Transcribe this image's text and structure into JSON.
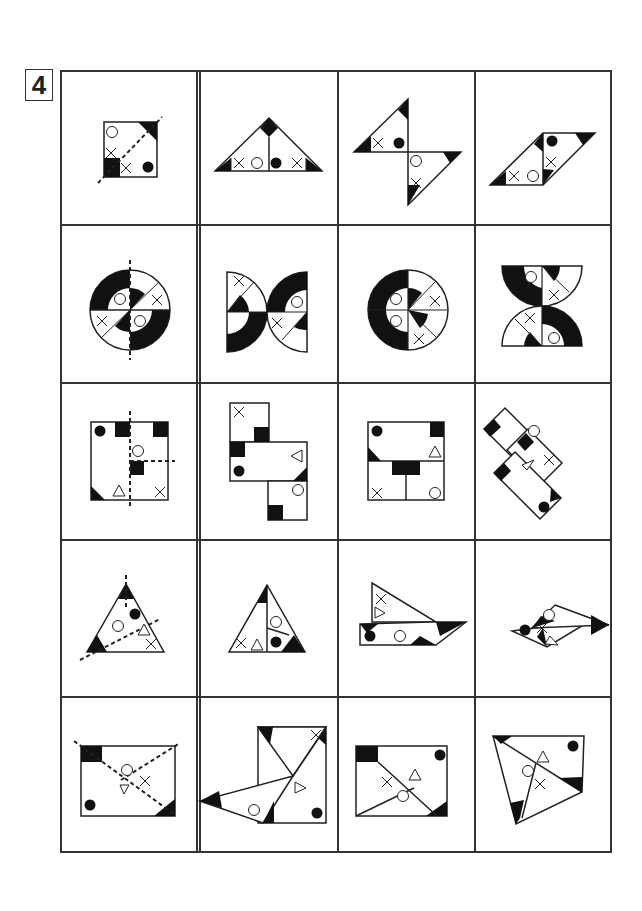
{
  "puzzle": {
    "number": "4",
    "rows": 5,
    "columns": 4,
    "layout_note": "First column separated by double line; each row: a folding template with dashed fold lines, followed by three candidate folded results",
    "symbols": [
      "circle-open",
      "circle-filled",
      "cross",
      "triangle-open",
      "black-corner"
    ],
    "cells": [
      {
        "row": 1,
        "col": 1,
        "shape": "square with diagonal dashed fold line",
        "marks": [
          "circle-open",
          "cross",
          "cross",
          "circle-filled"
        ]
      },
      {
        "row": 1,
        "col": 2,
        "shape": "triangle",
        "marks": [
          "cross",
          "circle-open",
          "circle-filled",
          "cross"
        ]
      },
      {
        "row": 1,
        "col": 3,
        "shape": "two triangles pinwheel",
        "marks": [
          "cross",
          "circle-filled",
          "circle-open",
          "cross"
        ]
      },
      {
        "row": 1,
        "col": 4,
        "shape": "parallelogram",
        "marks": [
          "circle-filled",
          "cross",
          "cross",
          "circle-open"
        ]
      },
      {
        "row": 2,
        "col": 1,
        "shape": "circle with vertical dashed fold line",
        "marks": [
          "circle-open",
          "cross",
          "cross",
          "circle-open"
        ]
      },
      {
        "row": 2,
        "col": 2,
        "shape": "two semicircles back to back",
        "marks": [
          "cross",
          "circle-open",
          "cross"
        ]
      },
      {
        "row": 2,
        "col": 3,
        "shape": "circle quarters",
        "marks": [
          "circle-open",
          "cross",
          "circle-open",
          "cross"
        ]
      },
      {
        "row": 2,
        "col": 4,
        "shape": "hourglass semicircles",
        "marks": [
          "circle-open",
          "cross",
          "cross",
          "circle-open"
        ]
      },
      {
        "row": 3,
        "col": 1,
        "shape": "square with cross dashed fold lines",
        "marks": [
          "circle-filled",
          "circle-open",
          "triangle-open",
          "cross"
        ]
      },
      {
        "row": 3,
        "col": 2,
        "shape": "stacked rectangles",
        "marks": [
          "cross",
          "triangle-open",
          "circle-filled",
          "circle-open"
        ]
      },
      {
        "row": 3,
        "col": 3,
        "shape": "square divided",
        "marks": [
          "circle-filled",
          "triangle-open",
          "cross",
          "circle-open"
        ]
      },
      {
        "row": 3,
        "col": 4,
        "shape": "rotated rectangles",
        "marks": [
          "circle-open",
          "cross",
          "triangle-open",
          "circle-filled"
        ]
      },
      {
        "row": 4,
        "col": 1,
        "shape": "triangle with two dashed fold lines",
        "marks": [
          "circle-filled",
          "circle-open",
          "triangle-open",
          "cross"
        ]
      },
      {
        "row": 4,
        "col": 2,
        "shape": "triangle split",
        "marks": [
          "circle-open",
          "cross",
          "triangle-open",
          "circle-filled"
        ]
      },
      {
        "row": 4,
        "col": 3,
        "shape": "folded arrow",
        "marks": [
          "cross",
          "triangle-open",
          "circle-filled",
          "circle-open"
        ]
      },
      {
        "row": 4,
        "col": 4,
        "shape": "rhombus folded",
        "marks": [
          "circle-open",
          "circle-filled",
          "cross",
          "triangle-open"
        ]
      },
      {
        "row": 5,
        "col": 1,
        "shape": "rectangle with diagonal dashed fold lines",
        "marks": [
          "circle-open",
          "triangle-open",
          "cross",
          "circle-filled"
        ]
      },
      {
        "row": 5,
        "col": 2,
        "shape": "unfolded flap",
        "marks": [
          "cross",
          "triangle-open",
          "circle-open",
          "circle-filled"
        ]
      },
      {
        "row": 5,
        "col": 3,
        "shape": "rectangle diagonals",
        "marks": [
          "circle-filled",
          "triangle-open",
          "cross",
          "circle-open"
        ]
      },
      {
        "row": 5,
        "col": 4,
        "shape": "folded quadrilateral",
        "marks": [
          "circle-filled",
          "triangle-open",
          "circle-open",
          "cross"
        ]
      }
    ]
  }
}
